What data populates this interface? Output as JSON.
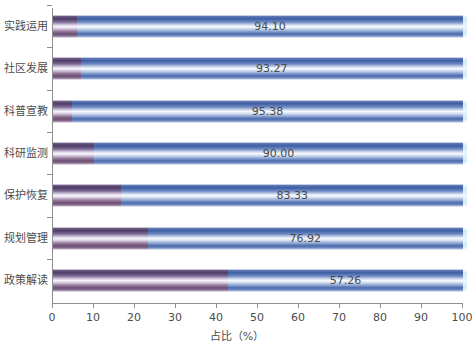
{
  "chart_data": {
    "type": "bar",
    "orientation": "horizontal",
    "stacked": true,
    "title": "",
    "subtitle": "",
    "xlabel": "占比（%）",
    "ylabel": "",
    "xlim": [
      0,
      100
    ],
    "xticks": [
      0,
      10,
      20,
      30,
      40,
      50,
      60,
      70,
      80,
      90,
      100
    ],
    "xtick_labels": [
      "0",
      "10",
      "20",
      "30",
      "40",
      "50",
      "60",
      "70",
      "80",
      "90",
      "100"
    ],
    "grid": false,
    "legend": false,
    "categories": [
      "实践运用",
      "社区发展",
      "科普宣教",
      "科研监测",
      "保护恢复",
      "规划管理",
      "政策解读"
    ],
    "values": [
      94.1,
      93.27,
      95.38,
      90.0,
      83.33,
      76.92,
      57.26
    ],
    "value_labels": [
      "94.10",
      "93.27",
      "95.38",
      "90.00",
      "83.33",
      "76.92",
      "57.26"
    ],
    "remainders": [
      5.9,
      6.73,
      4.62,
      10.0,
      16.67,
      23.08,
      42.74
    ],
    "series": [
      {
        "name": "remainder",
        "color": "#5b4477",
        "values": [
          5.9,
          6.73,
          4.62,
          10.0,
          16.67,
          23.08,
          42.74
        ]
      },
      {
        "name": "value",
        "color": "#3f5fa4",
        "values": [
          94.1,
          93.27,
          95.38,
          90.0,
          83.33,
          76.92,
          57.26
        ]
      }
    ],
    "colors": {
      "value_bar": "#3f5fa4",
      "remainder_bar": "#5b4477",
      "cap": "#cfeaf5",
      "axis": "#8e8e8e",
      "text": "#4c4c4c",
      "background": "#ffffff"
    }
  }
}
